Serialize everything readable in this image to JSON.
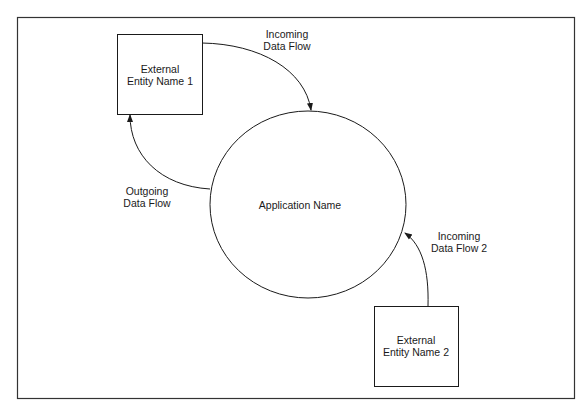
{
  "diagram": {
    "type": "context data flow diagram",
    "process": {
      "label": "Application Name"
    },
    "entities": [
      {
        "id": "entity1",
        "line1": "External",
        "line2": "Entity Name 1"
      },
      {
        "id": "entity2",
        "line1": "External",
        "line2": "Entity Name 2"
      }
    ],
    "flows": [
      {
        "id": "incoming1",
        "line1": "Incoming",
        "line2": "Data Flow",
        "from": "entity1",
        "to": "process"
      },
      {
        "id": "outgoing",
        "line1": "Outgoing",
        "line2": "Data Flow",
        "from": "process",
        "to": "entity1"
      },
      {
        "id": "incoming2",
        "line1": "Incoming",
        "line2": "Data Flow 2",
        "from": "entity2",
        "to": "process"
      }
    ]
  },
  "colors": {
    "stroke": "#1a1a1a",
    "background": "#ffffff"
  }
}
